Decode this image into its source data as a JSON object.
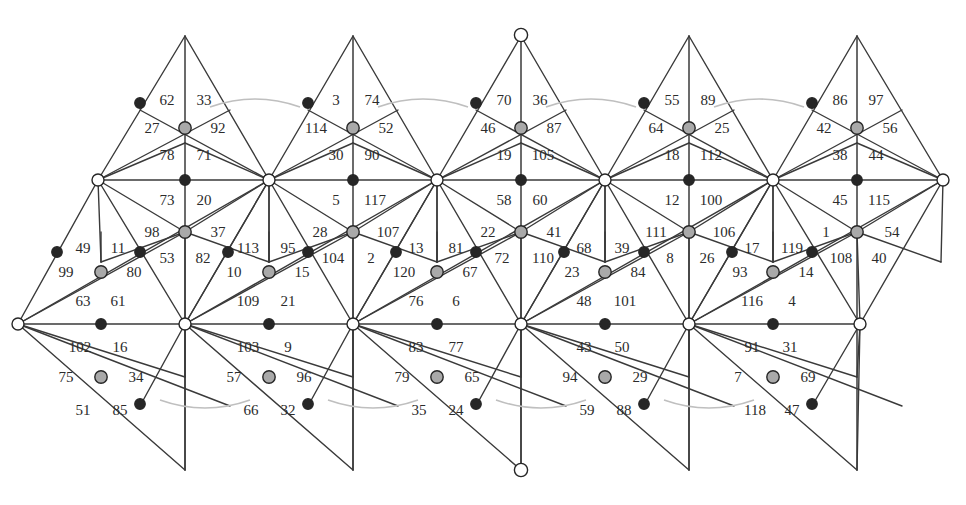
{
  "figure": {
    "kind": "triangulated-surface-net",
    "face_count": 120,
    "column_count": 5,
    "colors": {
      "line": "#3a3a3a",
      "label": "#2b2b2b",
      "vertex_white_fill": "#ffffff",
      "vertex_gray_fill": "#a9a9a9",
      "vertex_black_fill": "#262626",
      "vertex_stroke": "#262626",
      "arc": "#bfbfbf",
      "background": "#ffffff"
    },
    "geometry": {
      "width": 966,
      "height": 505,
      "column_pitch": 168,
      "column_x_centers": [
        185,
        353,
        521,
        689,
        857
      ],
      "row_y": {
        "apex_top": 36,
        "upper_mid": 110,
        "upper_node": 143,
        "spine_top": 180,
        "lower_mid": 232,
        "lower_node": 262,
        "spine_bottom": 324,
        "foot_mid": 377,
        "foot_node": 406,
        "apex_bottom": 470
      }
    }
  },
  "vertices": {
    "apex_top": [
      {
        "x": 185,
        "y": 36,
        "type": "plain"
      },
      {
        "x": 353,
        "y": 36,
        "type": "plain"
      },
      {
        "x": 521,
        "y": 35,
        "type": "white"
      },
      {
        "x": 689,
        "y": 36,
        "type": "plain"
      },
      {
        "x": 857,
        "y": 36,
        "type": "plain"
      }
    ],
    "apex_bottom": [
      {
        "x": 185,
        "y": 470,
        "type": "plain"
      },
      {
        "x": 353,
        "y": 470,
        "type": "plain"
      },
      {
        "x": 521,
        "y": 470,
        "type": "white"
      },
      {
        "x": 689,
        "y": 470,
        "type": "plain"
      },
      {
        "x": 857,
        "y": 470,
        "type": "plain"
      }
    ],
    "spine_top_white": [
      {
        "x": 98,
        "y": 180
      },
      {
        "x": 269,
        "y": 180
      },
      {
        "x": 437,
        "y": 180
      },
      {
        "x": 605,
        "y": 180
      },
      {
        "x": 773,
        "y": 180
      },
      {
        "x": 943,
        "y": 180
      }
    ],
    "spine_bottom_white": [
      {
        "x": 18,
        "y": 324
      },
      {
        "x": 185,
        "y": 324
      },
      {
        "x": 353,
        "y": 324
      },
      {
        "x": 521,
        "y": 324
      },
      {
        "x": 689,
        "y": 324
      },
      {
        "x": 860,
        "y": 324
      }
    ],
    "gray_nodes": [
      {
        "x": 185,
        "y": 128
      },
      {
        "x": 353,
        "y": 128
      },
      {
        "x": 521,
        "y": 128
      },
      {
        "x": 689,
        "y": 128
      },
      {
        "x": 857,
        "y": 128
      },
      {
        "x": 185,
        "y": 232
      },
      {
        "x": 353,
        "y": 232
      },
      {
        "x": 521,
        "y": 232
      },
      {
        "x": 689,
        "y": 232
      },
      {
        "x": 857,
        "y": 232
      },
      {
        "x": 101,
        "y": 272
      },
      {
        "x": 269,
        "y": 272
      },
      {
        "x": 437,
        "y": 272
      },
      {
        "x": 605,
        "y": 272
      },
      {
        "x": 773,
        "y": 272
      },
      {
        "x": 101,
        "y": 377
      },
      {
        "x": 269,
        "y": 377
      },
      {
        "x": 437,
        "y": 377
      },
      {
        "x": 605,
        "y": 377
      },
      {
        "x": 773,
        "y": 377
      }
    ],
    "black_nodes": [
      {
        "x": 140,
        "y": 103
      },
      {
        "x": 308,
        "y": 103
      },
      {
        "x": 476,
        "y": 103
      },
      {
        "x": 644,
        "y": 103
      },
      {
        "x": 812,
        "y": 103
      },
      {
        "x": 185,
        "y": 180
      },
      {
        "x": 353,
        "y": 180
      },
      {
        "x": 521,
        "y": 180
      },
      {
        "x": 689,
        "y": 180
      },
      {
        "x": 857,
        "y": 180
      },
      {
        "x": 140,
        "y": 252
      },
      {
        "x": 228,
        "y": 252
      },
      {
        "x": 308,
        "y": 252
      },
      {
        "x": 396,
        "y": 252
      },
      {
        "x": 476,
        "y": 252
      },
      {
        "x": 564,
        "y": 252
      },
      {
        "x": 644,
        "y": 252
      },
      {
        "x": 732,
        "y": 252
      },
      {
        "x": 812,
        "y": 252
      },
      {
        "x": 57,
        "y": 252
      },
      {
        "x": 101,
        "y": 324
      },
      {
        "x": 269,
        "y": 324
      },
      {
        "x": 437,
        "y": 324
      },
      {
        "x": 605,
        "y": 324
      },
      {
        "x": 773,
        "y": 324
      },
      {
        "x": 140,
        "y": 404
      },
      {
        "x": 308,
        "y": 404
      },
      {
        "x": 476,
        "y": 404
      },
      {
        "x": 644,
        "y": 404
      },
      {
        "x": 812,
        "y": 404
      }
    ]
  },
  "arcs": {
    "note": "Light gray identification arcs pairing boundary edges",
    "top": [
      {
        "x1": 210,
        "y1": 107,
        "x2": 300,
        "y2": 107,
        "sag": -10
      },
      {
        "x1": 378,
        "y1": 107,
        "x2": 468,
        "y2": 107,
        "sag": -10
      },
      {
        "x1": 546,
        "y1": 107,
        "x2": 636,
        "y2": 107,
        "sag": -10
      },
      {
        "x1": 714,
        "y1": 107,
        "x2": 804,
        "y2": 107,
        "sag": -10
      }
    ],
    "bottom": [
      {
        "x1": 160,
        "y1": 400,
        "x2": 250,
        "y2": 400,
        "sag": 10
      },
      {
        "x1": 328,
        "y1": 400,
        "x2": 418,
        "y2": 400,
        "sag": 10
      },
      {
        "x1": 496,
        "y1": 400,
        "x2": 586,
        "y2": 400,
        "sag": 10
      },
      {
        "x1": 664,
        "y1": 400,
        "x2": 754,
        "y2": 400,
        "sag": 10
      }
    ]
  },
  "face_labels": [
    {
      "t": "62",
      "x": 167,
      "y": 100
    },
    {
      "t": "33",
      "x": 204,
      "y": 100
    },
    {
      "t": "27",
      "x": 152,
      "y": 128
    },
    {
      "t": "92",
      "x": 218,
      "y": 128
    },
    {
      "t": "78",
      "x": 167,
      "y": 155
    },
    {
      "t": "71",
      "x": 204,
      "y": 155
    },
    {
      "t": "73",
      "x": 167,
      "y": 200
    },
    {
      "t": "20",
      "x": 204,
      "y": 200
    },
    {
      "t": "98",
      "x": 152,
      "y": 232
    },
    {
      "t": "37",
      "x": 218,
      "y": 232
    },
    {
      "t": "49",
      "x": 83,
      "y": 248
    },
    {
      "t": "11",
      "x": 118,
      "y": 248
    },
    {
      "t": "53",
      "x": 167,
      "y": 258
    },
    {
      "t": "82",
      "x": 203,
      "y": 258
    },
    {
      "t": "99",
      "x": 66,
      "y": 272
    },
    {
      "t": "80",
      "x": 134,
      "y": 272
    },
    {
      "t": "63",
      "x": 83,
      "y": 301
    },
    {
      "t": "61",
      "x": 118,
      "y": 301
    },
    {
      "t": "102",
      "x": 80,
      "y": 347
    },
    {
      "t": "16",
      "x": 120,
      "y": 347
    },
    {
      "t": "75",
      "x": 66,
      "y": 377
    },
    {
      "t": "34",
      "x": 136,
      "y": 377
    },
    {
      "t": "51",
      "x": 83,
      "y": 410
    },
    {
      "t": "85",
      "x": 120,
      "y": 410
    },
    {
      "t": "3",
      "x": 336,
      "y": 100
    },
    {
      "t": "74",
      "x": 372,
      "y": 100
    },
    {
      "t": "114",
      "x": 316,
      "y": 128
    },
    {
      "t": "52",
      "x": 386,
      "y": 128
    },
    {
      "t": "30",
      "x": 336,
      "y": 155
    },
    {
      "t": "90",
      "x": 372,
      "y": 155
    },
    {
      "t": "5",
      "x": 336,
      "y": 200
    },
    {
      "t": "117",
      "x": 375,
      "y": 200
    },
    {
      "t": "28",
      "x": 320,
      "y": 232
    },
    {
      "t": "107",
      "x": 388,
      "y": 232
    },
    {
      "t": "113",
      "x": 248,
      "y": 248
    },
    {
      "t": "95",
      "x": 288,
      "y": 248
    },
    {
      "t": "104",
      "x": 333,
      "y": 258
    },
    {
      "t": "2",
      "x": 371,
      "y": 258
    },
    {
      "t": "10",
      "x": 234,
      "y": 272
    },
    {
      "t": "15",
      "x": 302,
      "y": 272
    },
    {
      "t": "109",
      "x": 248,
      "y": 301
    },
    {
      "t": "21",
      "x": 288,
      "y": 301
    },
    {
      "t": "103",
      "x": 248,
      "y": 347
    },
    {
      "t": "9",
      "x": 288,
      "y": 347
    },
    {
      "t": "57",
      "x": 234,
      "y": 377
    },
    {
      "t": "96",
      "x": 304,
      "y": 377
    },
    {
      "t": "66",
      "x": 251,
      "y": 410
    },
    {
      "t": "32",
      "x": 288,
      "y": 410
    },
    {
      "t": "70",
      "x": 504,
      "y": 100
    },
    {
      "t": "36",
      "x": 540,
      "y": 100
    },
    {
      "t": "46",
      "x": 488,
      "y": 128
    },
    {
      "t": "87",
      "x": 554,
      "y": 128
    },
    {
      "t": "19",
      "x": 504,
      "y": 155
    },
    {
      "t": "105",
      "x": 543,
      "y": 155
    },
    {
      "t": "58",
      "x": 504,
      "y": 200
    },
    {
      "t": "60",
      "x": 540,
      "y": 200
    },
    {
      "t": "22",
      "x": 488,
      "y": 232
    },
    {
      "t": "41",
      "x": 554,
      "y": 232
    },
    {
      "t": "13",
      "x": 416,
      "y": 248
    },
    {
      "t": "81",
      "x": 456,
      "y": 248
    },
    {
      "t": "72",
      "x": 502,
      "y": 258
    },
    {
      "t": "110",
      "x": 543,
      "y": 258
    },
    {
      "t": "120",
      "x": 404,
      "y": 272
    },
    {
      "t": "67",
      "x": 470,
      "y": 272
    },
    {
      "t": "76",
      "x": 416,
      "y": 301
    },
    {
      "t": "6",
      "x": 456,
      "y": 301
    },
    {
      "t": "83",
      "x": 416,
      "y": 347
    },
    {
      "t": "77",
      "x": 456,
      "y": 347
    },
    {
      "t": "79",
      "x": 402,
      "y": 377
    },
    {
      "t": "65",
      "x": 472,
      "y": 377
    },
    {
      "t": "35",
      "x": 419,
      "y": 410
    },
    {
      "t": "24",
      "x": 456,
      "y": 410
    },
    {
      "t": "55",
      "x": 672,
      "y": 100
    },
    {
      "t": "89",
      "x": 708,
      "y": 100
    },
    {
      "t": "64",
      "x": 656,
      "y": 128
    },
    {
      "t": "25",
      "x": 722,
      "y": 128
    },
    {
      "t": "18",
      "x": 672,
      "y": 155
    },
    {
      "t": "112",
      "x": 711,
      "y": 155
    },
    {
      "t": "12",
      "x": 672,
      "y": 200
    },
    {
      "t": "100",
      "x": 711,
      "y": 200
    },
    {
      "t": "111",
      "x": 656,
      "y": 232
    },
    {
      "t": "106",
      "x": 724,
      "y": 232
    },
    {
      "t": "68",
      "x": 584,
      "y": 248
    },
    {
      "t": "39",
      "x": 622,
      "y": 248
    },
    {
      "t": "8",
      "x": 670,
      "y": 258
    },
    {
      "t": "26",
      "x": 707,
      "y": 258
    },
    {
      "t": "23",
      "x": 572,
      "y": 272
    },
    {
      "t": "84",
      "x": 638,
      "y": 272
    },
    {
      "t": "48",
      "x": 584,
      "y": 301
    },
    {
      "t": "101",
      "x": 625,
      "y": 301
    },
    {
      "t": "43",
      "x": 584,
      "y": 347
    },
    {
      "t": "50",
      "x": 622,
      "y": 347
    },
    {
      "t": "94",
      "x": 570,
      "y": 377
    },
    {
      "t": "29",
      "x": 640,
      "y": 377
    },
    {
      "t": "59",
      "x": 587,
      "y": 410
    },
    {
      "t": "88",
      "x": 624,
      "y": 410
    },
    {
      "t": "86",
      "x": 840,
      "y": 100
    },
    {
      "t": "97",
      "x": 876,
      "y": 100
    },
    {
      "t": "42",
      "x": 824,
      "y": 128
    },
    {
      "t": "56",
      "x": 890,
      "y": 128
    },
    {
      "t": "38",
      "x": 840,
      "y": 155
    },
    {
      "t": "44",
      "x": 876,
      "y": 155
    },
    {
      "t": "45",
      "x": 840,
      "y": 200
    },
    {
      "t": "115",
      "x": 879,
      "y": 200
    },
    {
      "t": "1",
      "x": 826,
      "y": 232
    },
    {
      "t": "54",
      "x": 892,
      "y": 232
    },
    {
      "t": "17",
      "x": 752,
      "y": 248
    },
    {
      "t": "119",
      "x": 792,
      "y": 248
    },
    {
      "t": "108",
      "x": 841,
      "y": 258
    },
    {
      "t": "40",
      "x": 879,
      "y": 258
    },
    {
      "t": "93",
      "x": 740,
      "y": 272
    },
    {
      "t": "14",
      "x": 806,
      "y": 272
    },
    {
      "t": "116",
      "x": 752,
      "y": 301
    },
    {
      "t": "4",
      "x": 792,
      "y": 301
    },
    {
      "t": "91",
      "x": 752,
      "y": 347
    },
    {
      "t": "31",
      "x": 790,
      "y": 347
    },
    {
      "t": "7",
      "x": 738,
      "y": 377
    },
    {
      "t": "69",
      "x": 808,
      "y": 377
    },
    {
      "t": "118",
      "x": 755,
      "y": 410
    },
    {
      "t": "47",
      "x": 792,
      "y": 410
    }
  ]
}
